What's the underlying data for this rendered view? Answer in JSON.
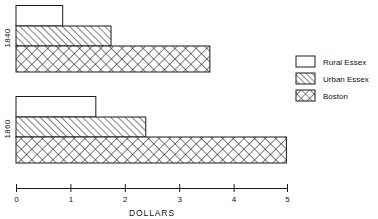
{
  "chart_data": {
    "type": "bar",
    "orientation": "horizontal",
    "title": "",
    "xlabel": "DOLLARS",
    "ylabel": "",
    "xlim": [
      0,
      5
    ],
    "xticks": [
      0,
      1,
      2,
      3,
      4,
      5
    ],
    "xtick_labels": [
      "0",
      "1",
      "2",
      "3",
      "4",
      "5"
    ],
    "categories": [
      "1840",
      "1860"
    ],
    "grid": false,
    "legend_position": "right",
    "series": [
      {
        "name": "Rural Essex",
        "fill": "solid-white",
        "values": [
          0.86,
          1.47
        ]
      },
      {
        "name": "Urban Essex",
        "fill": "diagonal-hatch",
        "values": [
          1.75,
          2.39
        ]
      },
      {
        "name": "Boston",
        "fill": "cross-hatch",
        "values": [
          3.57,
          4.98
        ]
      }
    ]
  },
  "axis": {
    "title": "DOLLARS",
    "ticks": [
      {
        "label": "0",
        "value": 0
      },
      {
        "label": "1",
        "value": 1
      },
      {
        "label": "2",
        "value": 2
      },
      {
        "label": "3",
        "value": 3
      },
      {
        "label": "4",
        "value": 4
      },
      {
        "label": "5",
        "value": 5
      }
    ]
  },
  "groups": [
    {
      "label": "1840"
    },
    {
      "label": "1860"
    }
  ],
  "legend": {
    "items": [
      {
        "label": "Rural Essex",
        "swatch": "solid-white-swatch"
      },
      {
        "label": "Urban Essex",
        "swatch": "diagonal-hatch-swatch"
      },
      {
        "label": "Boston",
        "swatch": "cross-hatch-swatch"
      }
    ]
  },
  "colors": {
    "stroke": "#1a1a1a",
    "background": "#ffffff"
  }
}
